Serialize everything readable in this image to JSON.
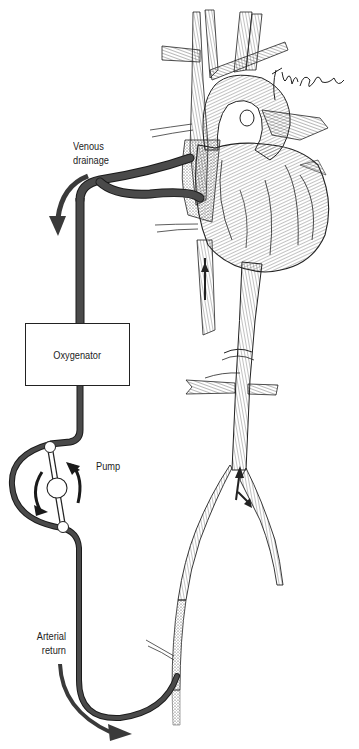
{
  "diagram": {
    "labels": {
      "venous_line1": "Venous",
      "venous_line2": "drainage",
      "oxygenator": "Oxygenator",
      "pump": "Pump",
      "arterial_line1": "Arterial",
      "arterial_line2": "return"
    },
    "signature": "artist signature",
    "colors": {
      "tubing": "#4a4a4a",
      "tubing_outline": "#1a1a1a",
      "arrow": "#3a3a3a",
      "ink": "#222222",
      "background": "#ffffff"
    },
    "components": [
      {
        "name": "venous-cannulae",
        "description": "Two cannulae draining superior and inferior vena cava"
      },
      {
        "name": "oxygenator",
        "description": "Rectangular oxygenator unit"
      },
      {
        "name": "roller-pump",
        "description": "Roller pump with two rollers and rotating arrows"
      },
      {
        "name": "arterial-cannula",
        "description": "Arterial return cannula into femoral artery"
      },
      {
        "name": "heart",
        "description": "Engraved illustration of heart and great vessels"
      },
      {
        "name": "aorta",
        "description": "Descending aorta with renal branches and iliac bifurcation"
      }
    ]
  }
}
